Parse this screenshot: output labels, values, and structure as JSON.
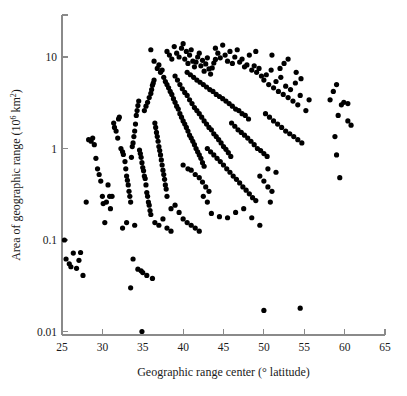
{
  "figure": {
    "background_color": "#ffffff",
    "point_color": "#000000",
    "axis_color": "#8a8a8a",
    "point_radius": 2.6
  },
  "chart_data": {
    "type": "scatter",
    "title": "",
    "xlabel": "Geographic range center (° latitude)",
    "ylabel": "Area of geographic range (10⁶ km²)",
    "ylabel_parts": {
      "prefix": "Area of geographic range (10",
      "exponent_1": "6",
      "middle": " km",
      "exponent_2": "2",
      "suffix": ")"
    },
    "xlabel_parts": {
      "prefix": "Geographic range center (",
      "degree": "°",
      "suffix": " latitude)"
    },
    "xscale": "linear",
    "yscale": "log",
    "xlim": [
      25,
      65
    ],
    "ylim": [
      0.01,
      30
    ],
    "xticks": [
      25,
      30,
      35,
      40,
      45,
      50,
      55,
      60,
      65
    ],
    "xtick_labels": [
      "25",
      "30",
      "35",
      "40",
      "45",
      "50",
      "55",
      "60",
      "65"
    ],
    "yticks": [
      0.01,
      0.1,
      1,
      10
    ],
    "ytick_labels": [
      "0.01",
      "0.1",
      "1",
      "10"
    ],
    "grid": false,
    "legend": null,
    "series_name": "species",
    "n_points": 330,
    "points": [
      [
        25.3,
        0.1
      ],
      [
        25.5,
        0.062
      ],
      [
        25.9,
        0.055
      ],
      [
        26.1,
        0.051
      ],
      [
        26.4,
        0.072
      ],
      [
        26.8,
        0.049
      ],
      [
        27.1,
        0.06
      ],
      [
        27.3,
        0.073
      ],
      [
        27.6,
        0.041
      ],
      [
        28.0,
        0.26
      ],
      [
        28.3,
        1.25
      ],
      [
        28.6,
        1.2
      ],
      [
        28.8,
        1.3
      ],
      [
        29.0,
        1.1
      ],
      [
        29.2,
        0.78
      ],
      [
        29.4,
        0.6
      ],
      [
        29.6,
        0.52
      ],
      [
        29.8,
        0.44
      ],
      [
        30.0,
        0.3
      ],
      [
        30.1,
        0.25
      ],
      [
        30.3,
        0.155
      ],
      [
        30.5,
        0.26
      ],
      [
        30.7,
        0.4
      ],
      [
        30.9,
        0.3
      ],
      [
        31.0,
        0.22
      ],
      [
        31.2,
        0.3
      ],
      [
        31.4,
        1.9
      ],
      [
        31.5,
        1.7
      ],
      [
        31.7,
        1.55
      ],
      [
        31.9,
        1.3
      ],
      [
        32.0,
        2.1
      ],
      [
        32.1,
        2.2
      ],
      [
        32.3,
        1.0
      ],
      [
        32.5,
        0.92
      ],
      [
        32.6,
        0.86
      ],
      [
        32.8,
        0.72
      ],
      [
        32.9,
        0.6
      ],
      [
        33.0,
        0.5
      ],
      [
        33.1,
        0.45
      ],
      [
        33.2,
        0.4
      ],
      [
        33.3,
        0.34
      ],
      [
        33.4,
        0.3
      ],
      [
        33.5,
        0.26
      ],
      [
        33.6,
        0.8
      ],
      [
        33.7,
        1.05
      ],
      [
        33.8,
        1.15
      ],
      [
        33.9,
        1.35
      ],
      [
        34.0,
        1.55
      ],
      [
        34.1,
        1.85
      ],
      [
        34.2,
        2.3
      ],
      [
        34.3,
        2.6
      ],
      [
        34.4,
        2.95
      ],
      [
        34.5,
        3.3
      ],
      [
        34.6,
        0.96
      ],
      [
        34.7,
        0.88
      ],
      [
        34.8,
        0.8
      ],
      [
        34.9,
        0.7
      ],
      [
        35.0,
        0.62
      ],
      [
        35.1,
        0.57
      ],
      [
        35.2,
        0.5
      ],
      [
        35.3,
        0.47
      ],
      [
        35.4,
        0.4
      ],
      [
        35.5,
        0.33
      ],
      [
        35.6,
        0.3
      ],
      [
        35.7,
        0.26
      ],
      [
        35.8,
        0.24
      ],
      [
        35.9,
        0.21
      ],
      [
        36.0,
        0.19
      ],
      [
        34.8,
        0.046
      ],
      [
        34.9,
        0.01
      ],
      [
        33.5,
        0.03
      ],
      [
        35.2,
        2.6
      ],
      [
        35.4,
        2.9
      ],
      [
        35.6,
        3.2
      ],
      [
        35.8,
        3.6
      ],
      [
        36.0,
        4.0
      ],
      [
        36.1,
        4.4
      ],
      [
        36.2,
        4.9
      ],
      [
        36.3,
        5.2
      ],
      [
        36.4,
        5.6
      ],
      [
        36.5,
        1.9
      ],
      [
        36.6,
        1.7
      ],
      [
        36.7,
        1.5
      ],
      [
        36.8,
        1.35
      ],
      [
        36.9,
        1.2
      ],
      [
        37.0,
        1.05
      ],
      [
        37.1,
        0.95
      ],
      [
        37.2,
        0.85
      ],
      [
        37.3,
        0.75
      ],
      [
        37.4,
        0.66
      ],
      [
        37.5,
        0.58
      ],
      [
        37.6,
        0.52
      ],
      [
        37.7,
        0.46
      ],
      [
        37.8,
        0.4
      ],
      [
        37.9,
        0.36
      ],
      [
        38.0,
        0.3
      ],
      [
        36.0,
        12.0
      ],
      [
        36.4,
        9.0
      ],
      [
        36.8,
        7.5
      ],
      [
        37.0,
        8.2
      ],
      [
        37.2,
        6.8
      ],
      [
        37.4,
        7.2
      ],
      [
        37.6,
        6.0
      ],
      [
        37.8,
        5.4
      ],
      [
        38.0,
        5.0
      ],
      [
        38.2,
        4.6
      ],
      [
        38.4,
        4.2
      ],
      [
        38.6,
        3.9
      ],
      [
        38.8,
        3.5
      ],
      [
        39.0,
        3.2
      ],
      [
        39.2,
        2.9
      ],
      [
        39.4,
        2.7
      ],
      [
        39.6,
        2.4
      ],
      [
        39.8,
        2.2
      ],
      [
        40.0,
        2.0
      ],
      [
        40.2,
        1.85
      ],
      [
        40.4,
        1.7
      ],
      [
        40.6,
        1.55
      ],
      [
        40.8,
        1.4
      ],
      [
        41.0,
        1.3
      ],
      [
        41.2,
        1.2
      ],
      [
        41.4,
        1.1
      ],
      [
        41.6,
        1.0
      ],
      [
        41.8,
        0.92
      ],
      [
        42.0,
        0.85
      ],
      [
        42.2,
        0.78
      ],
      [
        42.4,
        0.7
      ],
      [
        42.6,
        0.64
      ],
      [
        38.0,
        11.5
      ],
      [
        38.3,
        10.5
      ],
      [
        38.6,
        9.5
      ],
      [
        38.9,
        13.0
      ],
      [
        39.2,
        11.0
      ],
      [
        39.5,
        10.0
      ],
      [
        39.8,
        12.5
      ],
      [
        40.0,
        14.0
      ],
      [
        40.2,
        9.5
      ],
      [
        40.4,
        11.5
      ],
      [
        40.6,
        8.5
      ],
      [
        40.8,
        10.5
      ],
      [
        41.0,
        12.0
      ],
      [
        41.2,
        9.0
      ],
      [
        41.4,
        7.8
      ],
      [
        41.6,
        8.8
      ],
      [
        41.8,
        10.0
      ],
      [
        42.0,
        11.0
      ],
      [
        42.2,
        8.0
      ],
      [
        42.4,
        9.2
      ],
      [
        42.6,
        7.0
      ],
      [
        42.8,
        8.4
      ],
      [
        43.0,
        9.8
      ],
      [
        43.2,
        7.4
      ],
      [
        43.4,
        6.5
      ],
      [
        43.6,
        7.6
      ],
      [
        43.8,
        8.6
      ],
      [
        44.0,
        9.4
      ],
      [
        39.0,
        6.2
      ],
      [
        39.3,
        5.6
      ],
      [
        39.6,
        5.0
      ],
      [
        39.9,
        4.5
      ],
      [
        40.2,
        4.1
      ],
      [
        40.5,
        3.8
      ],
      [
        40.8,
        3.4
      ],
      [
        41.1,
        3.1
      ],
      [
        41.4,
        2.8
      ],
      [
        41.7,
        2.6
      ],
      [
        42.0,
        2.4
      ],
      [
        42.3,
        2.2
      ],
      [
        42.6,
        2.0
      ],
      [
        42.9,
        1.85
      ],
      [
        43.2,
        1.7
      ],
      [
        43.5,
        1.6
      ],
      [
        43.8,
        1.45
      ],
      [
        44.1,
        1.35
      ],
      [
        44.4,
        1.25
      ],
      [
        44.7,
        1.15
      ],
      [
        45.0,
        1.05
      ],
      [
        45.3,
        0.98
      ],
      [
        45.6,
        0.9
      ],
      [
        45.9,
        0.82
      ],
      [
        40.5,
        6.8
      ],
      [
        40.9,
        6.4
      ],
      [
        41.3,
        6.0
      ],
      [
        41.7,
        5.6
      ],
      [
        42.1,
        5.3
      ],
      [
        42.5,
        5.0
      ],
      [
        42.9,
        4.7
      ],
      [
        43.3,
        4.4
      ],
      [
        43.7,
        4.2
      ],
      [
        44.1,
        3.9
      ],
      [
        44.5,
        3.7
      ],
      [
        44.9,
        3.5
      ],
      [
        45.3,
        3.3
      ],
      [
        45.7,
        3.1
      ],
      [
        46.1,
        2.9
      ],
      [
        46.5,
        2.7
      ],
      [
        46.9,
        2.6
      ],
      [
        47.3,
        2.4
      ],
      [
        47.7,
        2.3
      ],
      [
        48.1,
        2.1
      ],
      [
        44.0,
        12.5
      ],
      [
        44.3,
        11.0
      ],
      [
        44.6,
        9.8
      ],
      [
        44.9,
        13.5
      ],
      [
        45.2,
        10.5
      ],
      [
        45.5,
        9.0
      ],
      [
        45.8,
        11.5
      ],
      [
        46.1,
        8.5
      ],
      [
        46.4,
        10.0
      ],
      [
        46.7,
        12.0
      ],
      [
        47.0,
        8.8
      ],
      [
        47.3,
        9.5
      ],
      [
        47.6,
        7.8
      ],
      [
        47.9,
        8.2
      ],
      [
        48.2,
        10.5
      ],
      [
        48.5,
        7.2
      ],
      [
        48.8,
        8.0
      ],
      [
        49.1,
        6.8
      ],
      [
        49.4,
        7.5
      ],
      [
        49.7,
        6.2
      ],
      [
        43.0,
        1.0
      ],
      [
        43.4,
        0.92
      ],
      [
        43.8,
        0.85
      ],
      [
        44.2,
        0.78
      ],
      [
        44.6,
        0.72
      ],
      [
        45.0,
        0.66
      ],
      [
        45.4,
        0.6
      ],
      [
        45.8,
        0.55
      ],
      [
        46.2,
        0.5
      ],
      [
        46.6,
        0.46
      ],
      [
        47.0,
        0.42
      ],
      [
        47.4,
        0.38
      ],
      [
        47.8,
        0.35
      ],
      [
        48.2,
        0.32
      ],
      [
        48.6,
        0.29
      ],
      [
        49.0,
        0.27
      ],
      [
        42.0,
        0.48
      ],
      [
        42.4,
        0.43
      ],
      [
        42.8,
        0.38
      ],
      [
        43.2,
        0.34
      ],
      [
        41.0,
        0.58
      ],
      [
        41.5,
        0.52
      ],
      [
        40.0,
        0.66
      ],
      [
        40.6,
        0.6
      ],
      [
        38.5,
        0.22
      ],
      [
        39.0,
        0.24
      ],
      [
        39.5,
        0.2
      ],
      [
        40.0,
        0.17
      ],
      [
        40.5,
        0.155
      ],
      [
        41.0,
        0.145
      ],
      [
        41.5,
        0.135
      ],
      [
        42.0,
        0.125
      ],
      [
        42.5,
        0.3
      ],
      [
        43.0,
        0.26
      ],
      [
        36.5,
        0.155
      ],
      [
        37.0,
        0.145
      ],
      [
        37.5,
        0.17
      ],
      [
        38.0,
        0.135
      ],
      [
        38.5,
        0.125
      ],
      [
        34.0,
        0.145
      ],
      [
        33.0,
        0.155
      ],
      [
        32.5,
        0.135
      ],
      [
        33.8,
        0.062
      ],
      [
        34.4,
        0.048
      ],
      [
        35.0,
        0.044
      ],
      [
        35.5,
        0.041
      ],
      [
        36.2,
        0.038
      ],
      [
        46.0,
        1.9
      ],
      [
        46.4,
        1.75
      ],
      [
        46.8,
        1.6
      ],
      [
        47.2,
        1.5
      ],
      [
        47.6,
        1.4
      ],
      [
        48.0,
        1.3
      ],
      [
        48.4,
        1.2
      ],
      [
        48.8,
        1.1
      ],
      [
        49.2,
        1.0
      ],
      [
        49.6,
        0.95
      ],
      [
        50.0,
        0.88
      ],
      [
        50.4,
        0.82
      ],
      [
        50.0,
        5.6
      ],
      [
        50.3,
        6.4
      ],
      [
        50.6,
        5.0
      ],
      [
        50.9,
        7.2
      ],
      [
        51.2,
        4.6
      ],
      [
        51.5,
        5.4
      ],
      [
        51.8,
        4.2
      ],
      [
        52.1,
        6.0
      ],
      [
        52.4,
        3.9
      ],
      [
        52.7,
        4.8
      ],
      [
        53.0,
        3.6
      ],
      [
        53.3,
        4.4
      ],
      [
        53.6,
        3.3
      ],
      [
        53.9,
        5.2
      ],
      [
        54.2,
        3.0
      ],
      [
        54.5,
        3.8
      ],
      [
        50.2,
        2.4
      ],
      [
        50.7,
        2.2
      ],
      [
        51.2,
        2.0
      ],
      [
        51.7,
        1.85
      ],
      [
        52.2,
        1.7
      ],
      [
        52.7,
        1.55
      ],
      [
        53.2,
        1.45
      ],
      [
        53.7,
        1.35
      ],
      [
        54.2,
        1.25
      ],
      [
        54.7,
        1.15
      ],
      [
        55.2,
        2.6
      ],
      [
        55.6,
        3.4
      ],
      [
        49.5,
        0.5
      ],
      [
        50.0,
        0.44
      ],
      [
        50.5,
        0.38
      ],
      [
        51.0,
        0.34
      ],
      [
        48.5,
        0.175
      ],
      [
        49.5,
        0.145
      ],
      [
        50.5,
        0.6
      ],
      [
        51.5,
        0.55
      ],
      [
        50.8,
        0.26
      ],
      [
        52.5,
        8.5
      ],
      [
        53.0,
        9.5
      ],
      [
        51.0,
        10.5
      ],
      [
        49.0,
        11.5
      ],
      [
        52.0,
        7.5
      ],
      [
        54.0,
        6.8
      ],
      [
        54.6,
        5.8
      ],
      [
        47.5,
        0.22
      ],
      [
        46.5,
        0.2
      ],
      [
        45.5,
        0.175
      ],
      [
        58.2,
        3.4
      ],
      [
        58.6,
        4.2
      ],
      [
        59.0,
        5.0
      ],
      [
        59.6,
        3.0
      ],
      [
        59.9,
        3.2
      ],
      [
        60.4,
        3.1
      ],
      [
        59.2,
        2.3
      ],
      [
        58.8,
        1.35
      ],
      [
        59.0,
        0.85
      ],
      [
        59.4,
        0.48
      ],
      [
        60.4,
        2.0
      ],
      [
        60.8,
        1.8
      ],
      [
        44.5,
        0.18
      ],
      [
        43.5,
        0.195
      ],
      [
        50.0,
        0.017
      ],
      [
        54.5,
        0.018
      ]
    ]
  }
}
